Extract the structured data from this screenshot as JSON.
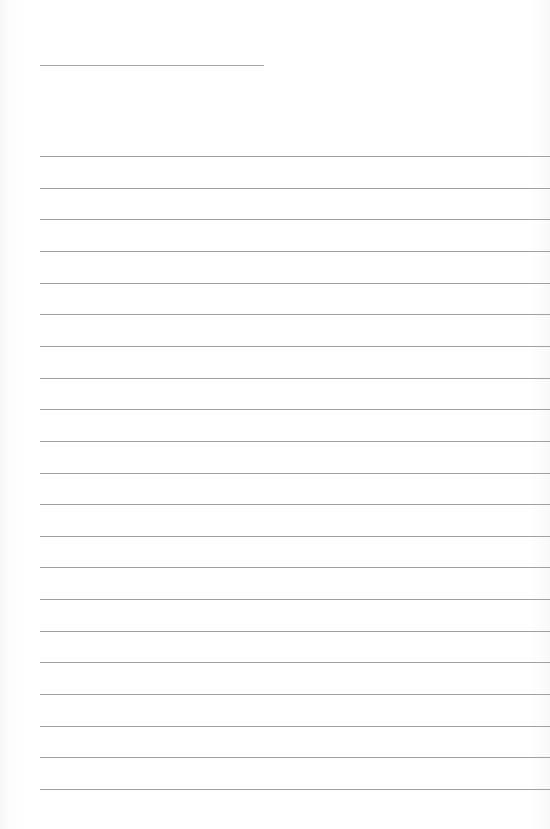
{
  "document": {
    "type": "lined-paper",
    "header_line": {
      "x": 40,
      "y": 65,
      "width": 224
    },
    "ruled_lines": {
      "count": 21,
      "start_y": 156,
      "spacing": 31.65,
      "left": 40,
      "color": "#a0a0a0"
    },
    "text": []
  }
}
